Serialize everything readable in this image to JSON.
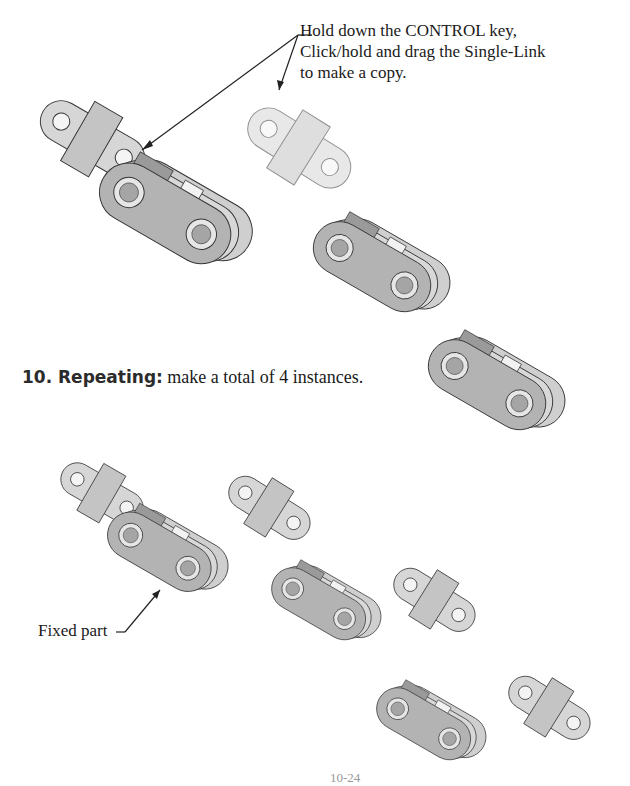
{
  "callout": {
    "lines": [
      "Hold down the CONTROL key,",
      "Click/hold and drag the Single-Link",
      "to make a copy."
    ]
  },
  "step": {
    "number": "10. Repeating:",
    "text": " make a total of 4 instances."
  },
  "fixed_label": "Fixed part",
  "page_number": "10-24",
  "figures": [
    {
      "name": "assembly-top",
      "description": "Double-link with single-link attached"
    },
    {
      "name": "single-link-copy-ghost",
      "description": "Transparent single-link being dragged"
    },
    {
      "name": "double-link-copy-1"
    },
    {
      "name": "double-link-copy-2"
    },
    {
      "name": "assembly-bottom-fixed"
    },
    {
      "name": "single-link-instance-1"
    },
    {
      "name": "double-link-instance-1"
    },
    {
      "name": "single-link-instance-2"
    },
    {
      "name": "double-link-instance-2"
    },
    {
      "name": "single-link-instance-3"
    }
  ],
  "colors": {
    "part_fill": "#b8b8b8",
    "part_dark": "#8e8e8e",
    "part_light": "#e0e0e0",
    "outline": "#333333"
  }
}
